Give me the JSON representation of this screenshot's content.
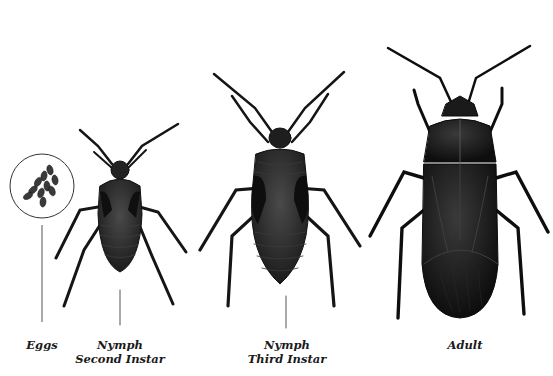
{
  "figure": {
    "stages": [
      {
        "id": "eggs",
        "label_line1": "Eggs",
        "label_line2": ""
      },
      {
        "id": "nymph-second-instar",
        "label_line1": "Nymph",
        "label_line2": "Second Instar"
      },
      {
        "id": "nymph-third-instar",
        "label_line1": "Nymph",
        "label_line2": "Third Instar"
      },
      {
        "id": "adult",
        "label_line1": "Adult",
        "label_line2": ""
      }
    ],
    "colors": {
      "background": "#ffffff",
      "insect_body": "#2b2b2b",
      "insect_dark": "#151515",
      "insect_highlight": "#4a4a4a",
      "leader_line": "#555555",
      "label_text": "#1a1a1a"
    }
  }
}
